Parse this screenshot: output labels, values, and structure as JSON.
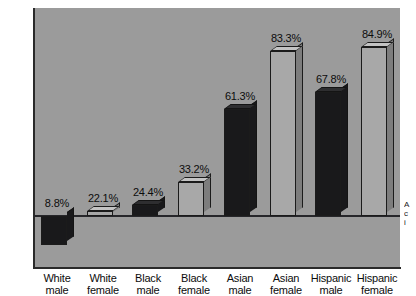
{
  "chart_data": {
    "type": "bar",
    "title": "",
    "subtitle": "",
    "xlabel": "",
    "ylabel": "",
    "ylim": [
      0,
      100
    ],
    "ytick_labels": [
      "0%",
      "20%",
      "40%",
      "60%",
      "80%",
      "100%"
    ],
    "ytick_values": [
      0,
      20,
      40,
      60,
      80,
      100
    ],
    "grid": false,
    "legend": null,
    "value_suffix": "%",
    "baseline_value": 20,
    "categories": [
      "White male",
      "White female",
      "Black male",
      "Black female",
      "Asian male",
      "Asian female",
      "Hispanic male",
      "Hispanic female"
    ],
    "category_lines": [
      [
        "White",
        "male"
      ],
      [
        "White",
        "female"
      ],
      [
        "Black",
        "male"
      ],
      [
        "Black",
        "female"
      ],
      [
        "Asian",
        "male"
      ],
      [
        "Asian",
        "female"
      ],
      [
        "Hispanic",
        "male"
      ],
      [
        "Hispanic",
        "female"
      ]
    ],
    "values": [
      8.8,
      22.1,
      24.4,
      33.2,
      61.3,
      83.3,
      67.8,
      84.9
    ],
    "value_labels": [
      "8.8%",
      "22.1%",
      "24.4%",
      "33.2%",
      "61.3%",
      "83.3%",
      "67.8%",
      "84.9%"
    ],
    "bar_styles": [
      "dark",
      "light",
      "dark",
      "light",
      "dark",
      "light",
      "dark",
      "light"
    ],
    "colors": {
      "plot_background": "#9b9b9b",
      "page_background": "#ffffff",
      "axis": "#2a2a2a",
      "bar_dark": "#19191b",
      "bar_dark_top": "#2e2e30",
      "bar_dark_side": "#19191b",
      "bar_light": "#a8a8a8",
      "bar_light_top": "#c3c3c3",
      "bar_light_side": "#7d7d7d",
      "text": "#0c0c0c"
    }
  },
  "edge_note": {
    "line1": "A",
    "line2": "c",
    "line3": "i"
  }
}
